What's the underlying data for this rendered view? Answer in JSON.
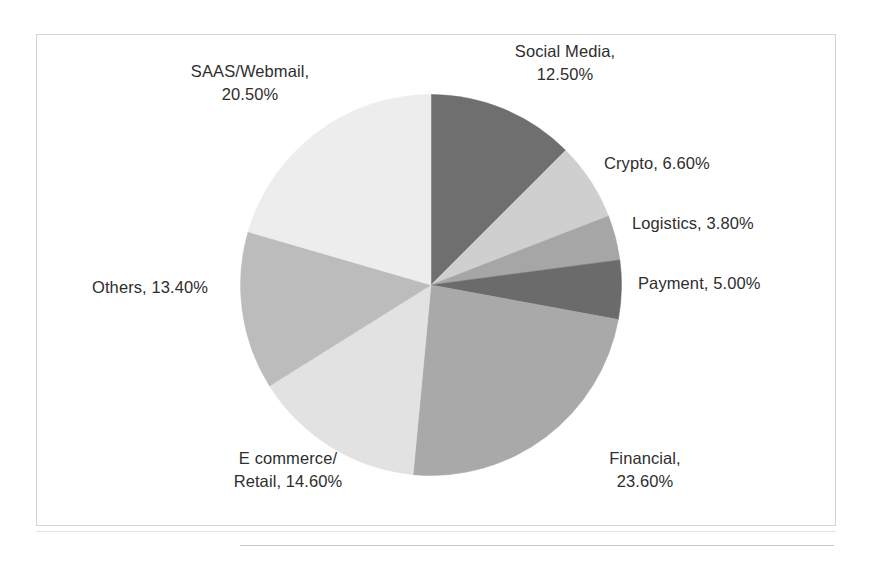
{
  "chart_data": {
    "type": "pie",
    "title": "",
    "subtitle": "",
    "xlabel": "",
    "ylabel": "",
    "legend_position": "none",
    "grid": false,
    "label_format": "{name}, {value}%",
    "start_angle_deg": 0,
    "direction": "clockwise",
    "categories": [
      "Social Media",
      "Crypto",
      "Logistics",
      "Payment",
      "Financial",
      "E commerce/ Retail",
      "Others",
      "SAAS/Webmail"
    ],
    "values": [
      12.5,
      6.6,
      3.8,
      5.0,
      23.6,
      14.6,
      13.4,
      20.5
    ],
    "slices": [
      {
        "name": "Social Media",
        "value": 12.5,
        "value_text": "12.50%",
        "label": "Social Media,\n12.50%",
        "color": "#6f6f6f"
      },
      {
        "name": "Crypto",
        "value": 6.6,
        "value_text": "6.60%",
        "label": "Crypto, 6.60%",
        "color": "#cfcfcf"
      },
      {
        "name": "Logistics",
        "value": 3.8,
        "value_text": "3.80%",
        "label": "Logistics, 3.80%",
        "color": "#a6a6a6"
      },
      {
        "name": "Payment",
        "value": 5.0,
        "value_text": "5.00%",
        "label": "Payment, 5.00%",
        "color": "#6b6b6b"
      },
      {
        "name": "Financial",
        "value": 23.6,
        "value_text": "23.60%",
        "label": "Financial,\n23.60%",
        "color": "#a9a9a9"
      },
      {
        "name": "E commerce/ Retail",
        "value": 14.6,
        "value_text": "14.60%",
        "label": "E commerce/\nRetail, 14.60%",
        "color": "#e2e2e2"
      },
      {
        "name": "Others",
        "value": 13.4,
        "value_text": "13.40%",
        "label": "Others, 13.40%",
        "color": "#bcbcbc"
      },
      {
        "name": "SAAS/Webmail",
        "value": 20.5,
        "value_text": "20.50%",
        "label": "SAAS/Webmail,\n20.50%",
        "color": "#ededed"
      }
    ],
    "total": 100.0
  },
  "frame": {
    "border_color": "#d2d2d2",
    "background": "#ffffff"
  }
}
